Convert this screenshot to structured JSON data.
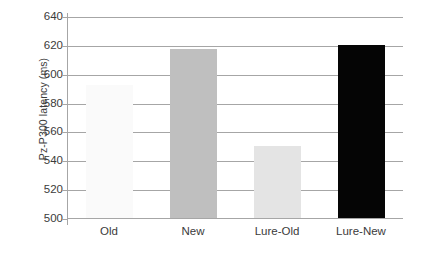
{
  "chart_data": {
    "type": "bar",
    "title": "",
    "xlabel": "",
    "ylabel": "Pz-P300 latency (ms)",
    "categories": [
      "Old",
      "New",
      "Lure-Old",
      "Lure-New"
    ],
    "values": [
      592,
      617,
      550,
      620
    ],
    "ylim": [
      500,
      640
    ],
    "yticks": [
      500,
      520,
      540,
      560,
      580,
      600,
      620,
      640
    ],
    "ytick_labels": [
      "500",
      "520",
      "540",
      "560",
      "580",
      "600",
      "620",
      "640"
    ],
    "grid": true,
    "legend": "none",
    "bar_colors": [
      "#fafafa",
      "#bfbfbf",
      "#e4e4e4",
      "#050505"
    ],
    "bar_edge_colors": [
      "#f2f2f2",
      "#bfbfbf",
      "#e4e4e4",
      "#050505"
    ],
    "axis_color": "#a6a6a6",
    "text_color": "#3b3b3b",
    "background": "#ffffff"
  }
}
